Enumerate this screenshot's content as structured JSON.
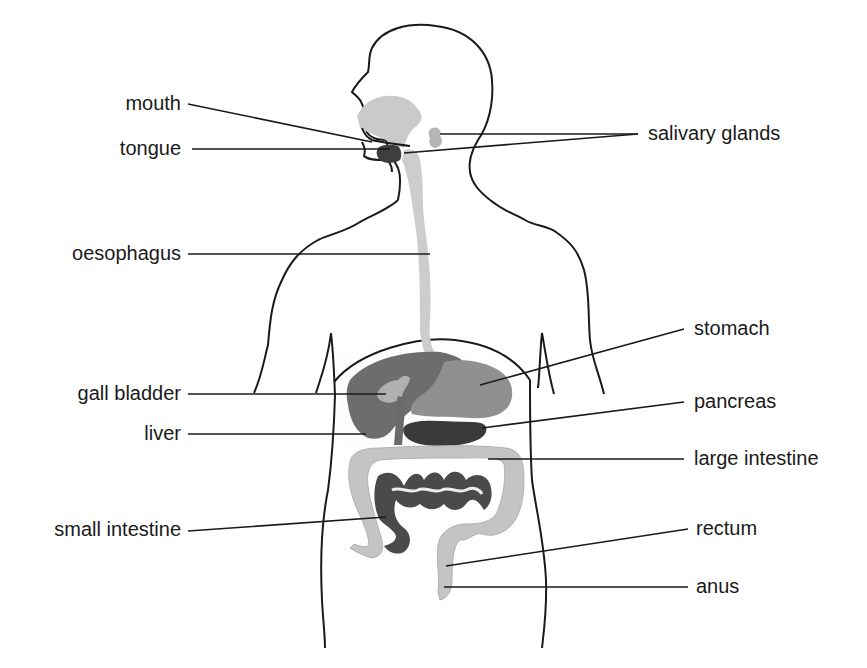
{
  "diagram": {
    "colors": {
      "outline": "#1a1a1a",
      "light_organ": "#c8c8c8",
      "mid_organ": "#8e8e8e",
      "dark_organ": "#555555",
      "darkest_organ": "#3a3a3a",
      "leader_line": "#1a1a1a"
    },
    "labels_left": [
      {
        "id": "mouth",
        "text": "mouth"
      },
      {
        "id": "tongue",
        "text": "tongue"
      },
      {
        "id": "oesophagus",
        "text": "oesophagus"
      },
      {
        "id": "gall_bladder",
        "text": "gall bladder"
      },
      {
        "id": "liver",
        "text": "liver"
      },
      {
        "id": "small_intestine",
        "text": "small intestine"
      }
    ],
    "labels_right": [
      {
        "id": "salivary_glands",
        "text": "salivary glands"
      },
      {
        "id": "stomach",
        "text": "stomach"
      },
      {
        "id": "pancreas",
        "text": "pancreas"
      },
      {
        "id": "large_intestine",
        "text": "large intestine"
      },
      {
        "id": "rectum",
        "text": "rectum"
      },
      {
        "id": "anus",
        "text": "anus"
      }
    ]
  }
}
